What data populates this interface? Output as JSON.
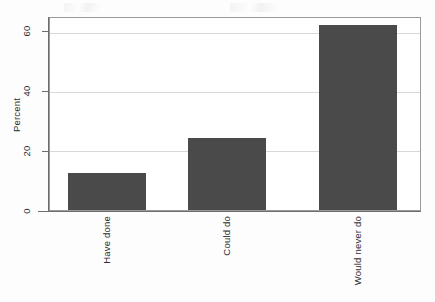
{
  "chart_data": {
    "type": "bar",
    "title": "",
    "subtitle": "",
    "xlabel": "",
    "ylabel": "Percent",
    "categories": [
      "Have done",
      "Could do",
      "Would never do"
    ],
    "values": [
      12.5,
      24.3,
      62.5
    ],
    "series": [
      {
        "name": "Percent",
        "values": [
          12.5,
          24.3,
          62.5
        ]
      }
    ],
    "ylim": [
      0,
      65
    ],
    "yticks": [
      0,
      20,
      40,
      60
    ],
    "ytick_labels": [
      "0",
      "20",
      "40",
      "60"
    ],
    "grid": true,
    "grid_axis": "y",
    "legend": false,
    "legend_position": "none",
    "bar_color": "#4a4a4a",
    "grid_color": "#d8d8d8",
    "axis_color": "#6e6e6e",
    "frame_color": "#9a9a9a",
    "background_color": "#ffffff",
    "xtick_label_rotation": -90,
    "annotations": []
  }
}
